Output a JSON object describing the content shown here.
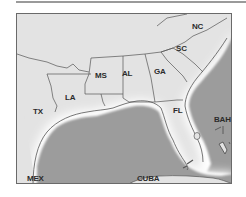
{
  "map": {
    "labels": {
      "nc": "NC",
      "sc": "SC",
      "ga": "GA",
      "al": "AL",
      "ms": "MS",
      "la": "LA",
      "tx": "TX",
      "fl": "FL",
      "bah": "BAH",
      "mex": "MEX",
      "cuba": "CUBA"
    },
    "colors": {
      "land": "#e3e3e3",
      "water": "#9c9c9c",
      "coast_glow": "#ffffff",
      "border": "#555555",
      "frame": "#6a6a6a"
    }
  }
}
